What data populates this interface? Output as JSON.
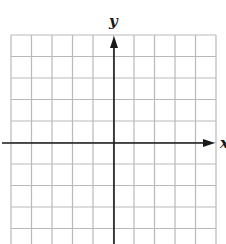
{
  "diagram": {
    "type": "coordinate-grid",
    "axis_labels": {
      "x": "x",
      "y": "y"
    },
    "grid": {
      "left": 11,
      "top": 35,
      "right": 216,
      "bottom": 244,
      "columns": 10,
      "cell_width": 20.5,
      "cell_height": 21.5,
      "line_color": "#b9b9b9"
    },
    "axes": {
      "origin_x": 114,
      "origin_y": 143,
      "color": "#1a1a1a",
      "x_arrow_end": 215,
      "y_arrow_end": 36
    }
  }
}
